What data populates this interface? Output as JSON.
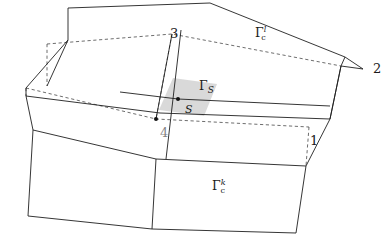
{
  "figure": {
    "width": 388,
    "height": 235,
    "background": "#ffffff",
    "line_color": "#1f1f1f",
    "dashed_color": "#3a3a3a",
    "shade_color": "#d4d4d4",
    "shade_opacity": 0.85
  },
  "labels": {
    "gamma_l": {
      "glyph": "Γ",
      "superscript": "l",
      "subscript": "c",
      "x": 255,
      "y": 27
    },
    "gamma_k": {
      "glyph": "Γ",
      "superscript": "k",
      "subscript": "c",
      "x": 212,
      "y": 180
    },
    "gamma_s": {
      "glyph": "Γ",
      "superscript": "",
      "subscript": "S",
      "x": 199,
      "y": 80
    },
    "point_s": {
      "text": "S",
      "x": 185,
      "y": 104
    },
    "vertex_1": {
      "text": "1",
      "x": 310,
      "y": 134
    },
    "vertex_2": {
      "text": "2",
      "x": 373,
      "y": 62
    },
    "vertex_3": {
      "text": "3",
      "x": 170,
      "y": 27
    },
    "vertex_4": {
      "text": "4",
      "x": 160,
      "y": 126
    }
  },
  "geometry": {
    "upper_surface_top_face": "M 68,8 L 210,3 L 345,57 L 196,66 Z",
    "upper_surface_front_edge": "M 68,8 L 68,38",
    "lower_surface_front_face": "M 26,88 L 158,158 L 300,148 L 170,66 Z",
    "notes": "quadrilateral facets drawn in SVG with solid visible edges and dashed hidden edges"
  },
  "markers": {
    "point_s": {
      "x": 178,
      "y": 99,
      "r": 2.1
    },
    "point_4": {
      "x": 156,
      "y": 119,
      "r": 2.1
    }
  }
}
